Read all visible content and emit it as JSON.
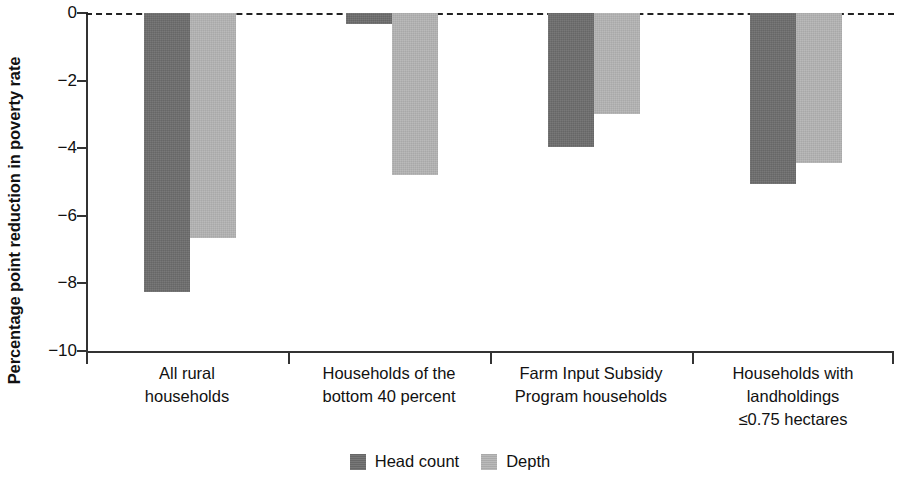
{
  "chart_data": {
    "type": "bar",
    "title": "",
    "xlabel": "",
    "ylabel": "Percentage point reduction in poverty rate",
    "ylim": [
      -10,
      0
    ],
    "yticks": [
      0,
      -2,
      -4,
      -6,
      -8,
      -10
    ],
    "ytick_labels": [
      "0",
      "−2",
      "−4",
      "−6",
      "−8",
      "−10"
    ],
    "grid": false,
    "zero_reference_line": true,
    "legend_position": "bottom-center",
    "categories": [
      "All rural households",
      "Households of the bottom 40 percent",
      "Farm Input Subsidy Program households",
      "Households with landholdings ≤0.75 hectares"
    ],
    "category_lines": [
      [
        "All rural",
        "households"
      ],
      [
        "Households of the",
        "bottom 40 percent"
      ],
      [
        "Farm Input Subsidy",
        "Program households"
      ],
      [
        "Households with",
        "landholdings",
        "≤0.75 hectares"
      ]
    ],
    "series": [
      {
        "name": "Head count",
        "color": "#6d6d6d",
        "values": [
          -8.25,
          -0.33,
          -3.95,
          -5.05
        ]
      },
      {
        "name": "Depth",
        "color": "#b4b4b4",
        "values": [
          -6.65,
          -4.8,
          -3.0,
          -4.45
        ]
      }
    ]
  },
  "legend": {
    "items": [
      {
        "label": "Head count",
        "swatch": "dark"
      },
      {
        "label": "Depth",
        "swatch": "light"
      }
    ]
  }
}
